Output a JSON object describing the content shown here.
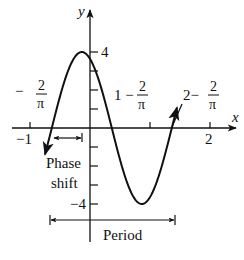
{
  "chart_data": {
    "type": "line",
    "title": "",
    "function": "y = 4 sin(pi*x + 2)",
    "amplitude": 4,
    "period": 2,
    "phase_shift": "-2/pi",
    "xlabel": "x",
    "ylabel": "y",
    "xlim": [
      -1.3,
      2.4
    ],
    "ylim": [
      -4.4,
      4.6
    ],
    "grid": false,
    "x_ticks": [
      -1,
      1,
      2
    ],
    "x_tick_labels": [
      "-1",
      "2"
    ],
    "y_ticks": [
      4,
      3,
      2,
      1,
      -1,
      -2,
      -3,
      -4
    ],
    "y_tick_labels": [
      {
        "value": 4,
        "label": "4"
      },
      {
        "value": -4,
        "label": "-4"
      }
    ],
    "key_points": [
      {
        "x": -0.637,
        "y": 0,
        "label": "-2/π"
      },
      {
        "x": -0.137,
        "y": 4,
        "label": "max"
      },
      {
        "x": 0.363,
        "y": 0,
        "label": "1 - 2/π"
      },
      {
        "x": 0.863,
        "y": -4,
        "label": "min"
      },
      {
        "x": 1.363,
        "y": 0,
        "label": "2 - 2/π"
      }
    ],
    "annotations": [
      {
        "text": "-2/π",
        "points_to_x": -0.637
      },
      {
        "text": "1 - 2/π",
        "points_to_x": 0.363
      },
      {
        "text": "2 - 2/π",
        "points_to_x": 1.363
      },
      {
        "text": "Phase shift",
        "span": [
          -0.637,
          0
        ]
      },
      {
        "text": "Period",
        "span": [
          -0.637,
          1.363
        ]
      }
    ]
  },
  "labels": {
    "y_axis": "y",
    "x_axis": "x",
    "y_tick_top": "4",
    "y_tick_bottom": "−4",
    "x_tick_neg1": "−1",
    "x_tick_2": "2",
    "neg_two_over_pi": {
      "sign": "−",
      "num": "2",
      "den": "π"
    },
    "one_minus": {
      "prefix": "1 −",
      "num": "2",
      "den": "π"
    },
    "two_minus": {
      "prefix": "2−",
      "num": "2",
      "den": "π"
    },
    "phase_line1": "Phase",
    "phase_line2": "shift",
    "period": "Period"
  }
}
